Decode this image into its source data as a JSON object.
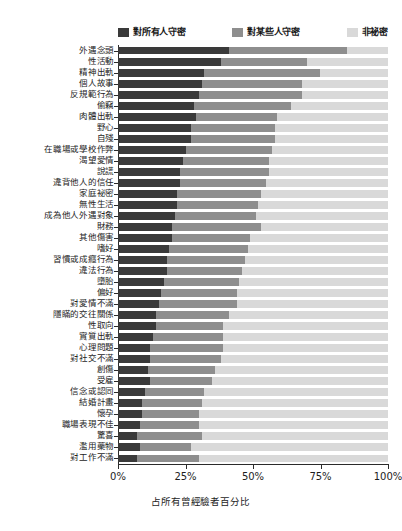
{
  "chart_data": {
    "type": "bar",
    "subtype": "horizontal-stacked-100",
    "title": "",
    "xlabel": "占所有曾經驗者百分比",
    "ylabel": "",
    "xlim": [
      0,
      100
    ],
    "xticks": [
      "0%",
      "25%",
      "50%",
      "75%",
      "100%"
    ],
    "xtick_values": [
      0,
      25,
      50,
      75,
      100
    ],
    "grid": false,
    "legend_position": "top",
    "colors": {
      "keep_from_all": "#3a3a3a",
      "keep_from_some": "#8e8e8e",
      "not_secret": "#d9d9d9",
      "axis": "#2b2b2b",
      "text": "#1d1d1d",
      "background": "#ffffff"
    },
    "series": [
      {
        "name": "對所有人守密",
        "key": "keep_from_all"
      },
      {
        "name": "對某些人守密",
        "key": "keep_from_some"
      },
      {
        "name": "非祕密",
        "key": "not_secret"
      }
    ],
    "categories": [
      "外遇念頭",
      "性活動",
      "精神出軌",
      "個人故事",
      "反規範行為",
      "偷竊",
      "肉體出軌",
      "野心",
      "自殘",
      "在職場或學校作弊",
      "渴望愛情",
      "說謊",
      "違背他人的信任",
      "家庭祕密",
      "無性生活",
      "成為他人外遇對象",
      "財務",
      "其他傷害",
      "嗜好",
      "習慣或成癮行為",
      "違法行為",
      "墮胎",
      "偏好",
      "對愛情不滿",
      "隱瞞的交往關係",
      "性取向",
      "實質出軌",
      "心理問題",
      "對社交不滿",
      "創傷",
      "受雇",
      "信念或認同",
      "結婚計畫",
      "懷孕",
      "職場表現不佳",
      "驚喜",
      "濫用藥物",
      "對工作不滿"
    ],
    "values": [
      [
        41,
        44,
        15
      ],
      [
        38,
        32,
        30
      ],
      [
        32,
        43,
        25
      ],
      [
        31,
        37,
        32
      ],
      [
        30,
        38,
        32
      ],
      [
        28,
        36,
        36
      ],
      [
        29,
        30,
        41
      ],
      [
        27,
        31,
        42
      ],
      [
        27,
        31,
        42
      ],
      [
        25,
        32,
        43
      ],
      [
        24,
        32,
        44
      ],
      [
        23,
        33,
        44
      ],
      [
        23,
        32,
        45
      ],
      [
        22,
        31,
        47
      ],
      [
        22,
        30,
        48
      ],
      [
        21,
        30,
        49
      ],
      [
        20,
        33,
        47
      ],
      [
        20,
        29,
        51
      ],
      [
        19,
        29,
        52
      ],
      [
        18,
        29,
        53
      ],
      [
        18,
        28,
        54
      ],
      [
        17,
        28,
        55
      ],
      [
        16,
        28,
        56
      ],
      [
        15,
        29,
        56
      ],
      [
        14,
        27,
        59
      ],
      [
        14,
        25,
        61
      ],
      [
        13,
        26,
        61
      ],
      [
        12,
        27,
        61
      ],
      [
        12,
        26,
        62
      ],
      [
        11,
        25,
        64
      ],
      [
        12,
        23,
        65
      ],
      [
        10,
        22,
        68
      ],
      [
        9,
        22,
        69
      ],
      [
        9,
        21,
        70
      ],
      [
        8,
        22,
        70
      ],
      [
        7,
        24,
        69
      ],
      [
        8,
        19,
        73
      ],
      [
        7,
        23,
        70
      ]
    ]
  },
  "legend": {
    "items": [
      {
        "label": "對所有人守密",
        "color": "#3a3a3a"
      },
      {
        "label": "對某些人守密",
        "color": "#8e8e8e"
      },
      {
        "label": "非祕密",
        "color": "#d9d9d9"
      }
    ]
  }
}
